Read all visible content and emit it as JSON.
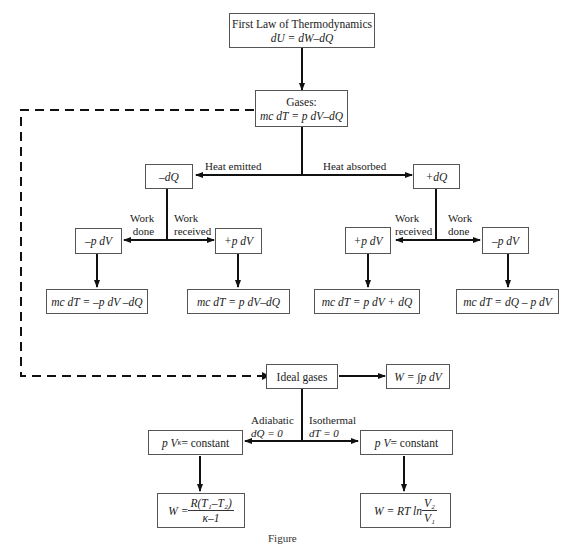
{
  "diagram": {
    "root": {
      "title": "First Law of Thermodynamics",
      "equation": "dU = dW–dQ"
    },
    "gases": {
      "title": "Gases:",
      "equation": "mc  dT = p dV–dQ"
    },
    "heat_branches": {
      "emitted_label": "Heat emitted",
      "absorbed_label": "Heat absorbed",
      "emitted_node": "–dQ",
      "absorbed_node": "+dQ"
    },
    "left_work": {
      "done_label_1": "Work",
      "done_label_2": "done",
      "received_label_1": "Work",
      "received_label_2": "received",
      "done_node": "–p dV",
      "received_node": "+p dV",
      "done_result": "mc dT = –p dV –dQ",
      "received_result": "mc dT = p dV–dQ"
    },
    "right_work": {
      "received_label_1": "Work",
      "received_label_2": "received",
      "done_label_1": "Work",
      "done_label_2": "done",
      "received_node": "+p dV",
      "done_node": "–p dV",
      "received_result": "mc dT = p dV + dQ",
      "done_result": "mc dT = dQ – p dV"
    },
    "ideal": {
      "title": "Ideal gases",
      "work_integral": "W = ∫p dV",
      "adiabatic_label_1": "Adiabatic",
      "adiabatic_label_2": "dQ = 0",
      "isothermal_label_1": "Isothermal",
      "isothermal_label_2": "dT = 0",
      "adiabatic_node_base": "p V",
      "adiabatic_node_exp": "κ",
      "adiabatic_node_rest": " = constant",
      "isothermal_node_base": "p V",
      "isothermal_node_rest": " = constant",
      "adiabatic_work_lhs": "W = ",
      "adiabatic_work_num": "R(T₁–T₂)",
      "adiabatic_work_den": "κ–1",
      "isothermal_work_lhs": "W = RT ln ",
      "isothermal_work_num": "V₂",
      "isothermal_work_den": "V₁"
    },
    "caption": "Figure"
  }
}
